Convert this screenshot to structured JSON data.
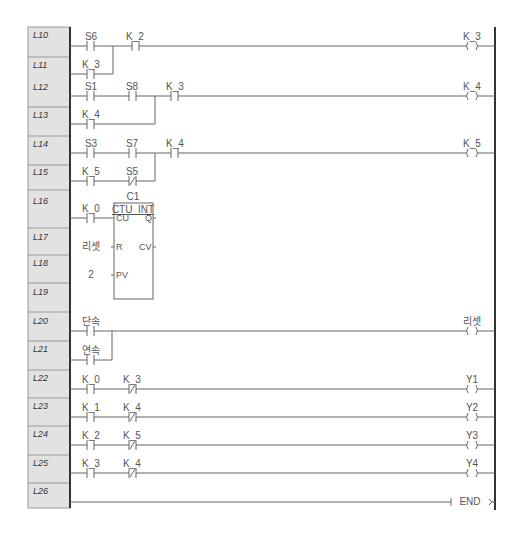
{
  "diagram": {
    "type": "ladder-logic",
    "colors": {
      "panel_bg": "#e2e2e2",
      "panel_border": "#9a9a9a",
      "rail": "#333333",
      "wire": "#666666",
      "text": "#555555"
    },
    "rows": [
      "L10",
      "L11",
      "L12",
      "L13",
      "L14",
      "L15",
      "L16",
      "L17",
      "L18",
      "L19",
      "L20",
      "L21",
      "L22",
      "L23",
      "L24",
      "L25",
      "L26"
    ],
    "rungs": [
      {
        "id": "r1",
        "contacts": [
          "S6",
          "K_3",
          "K_2"
        ],
        "coil": "K_3"
      },
      {
        "id": "r2",
        "contacts": [
          "S1",
          "S8",
          "K_4",
          "K_3"
        ],
        "coil": "K_4"
      },
      {
        "id": "r3",
        "contacts": [
          "S3",
          "S7",
          "K_5",
          "S5",
          "K_4"
        ],
        "coil": "K_5"
      },
      {
        "id": "r4",
        "block": {
          "instance": "C1",
          "type": "CTU_INT",
          "in_cu": "K_0",
          "in_r": "리셋",
          "in_pv": "2",
          "pin_cu": "CU",
          "pin_r": "R",
          "pin_pv": "PV",
          "pin_q": "Q",
          "pin_cv": "CV"
        }
      },
      {
        "id": "r5",
        "contacts": [
          "단속",
          "연속"
        ],
        "coil": "리셋"
      },
      {
        "id": "r6",
        "contacts": [
          "K_0",
          "K_3"
        ],
        "coil": "Y1"
      },
      {
        "id": "r7",
        "contacts": [
          "K_1",
          "K_4"
        ],
        "coil": "Y2"
      },
      {
        "id": "r8",
        "contacts": [
          "K_2",
          "K_5"
        ],
        "coil": "Y3"
      },
      {
        "id": "r9",
        "contacts": [
          "K_3",
          "K_4"
        ],
        "coil": "Y4"
      },
      {
        "id": "r10",
        "end": "END"
      }
    ]
  }
}
